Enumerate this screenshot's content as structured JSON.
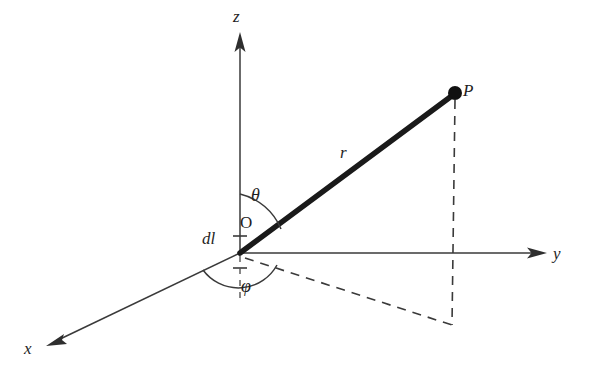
{
  "figure": {
    "background_color": "#ffffff",
    "ink_color": "#1f1f1f",
    "vector_color": "#1a1a1a"
  },
  "axes": [
    {
      "id": "z",
      "label": "z",
      "direction": "up",
      "label_x": 233,
      "label_y": 8
    },
    {
      "id": "y",
      "label": "y",
      "direction": "right",
      "label_x": 553,
      "label_y": 245
    },
    {
      "id": "x",
      "label": "x",
      "direction": "down-left",
      "label_x": 24,
      "label_y": 340
    }
  ],
  "points": [
    {
      "id": "origin",
      "label": "O",
      "label_x": 240,
      "label_y": 214
    },
    {
      "id": "field-point",
      "label": "P",
      "label_x": 463,
      "label_y": 82
    }
  ],
  "segments": [
    {
      "id": "radius",
      "label": "r",
      "label_x": 340,
      "label_y": 144,
      "style": "thick-solid"
    }
  ],
  "angles": [
    {
      "id": "theta",
      "label": "θ",
      "label_x": 251,
      "label_y": 186,
      "between": "z-axis and r"
    },
    {
      "id": "phi",
      "label": "φ",
      "label_x": 241,
      "label_y": 277,
      "between": "x-axis and projection of r"
    }
  ],
  "elements": [
    {
      "id": "current-element",
      "label": "dl",
      "label_x": 202,
      "label_y": 230
    }
  ],
  "geometry": {
    "origin": {
      "x": 240,
      "y": 253
    },
    "point_p": {
      "x": 455,
      "y": 93
    },
    "projection_corner": {
      "x": 452,
      "y": 325
    },
    "z_arrow_tip": {
      "x": 240,
      "y": 34
    },
    "y_arrow_tip": {
      "x": 546,
      "y": 253
    },
    "x_arrow_tip": {
      "x": 47,
      "y": 346
    }
  }
}
